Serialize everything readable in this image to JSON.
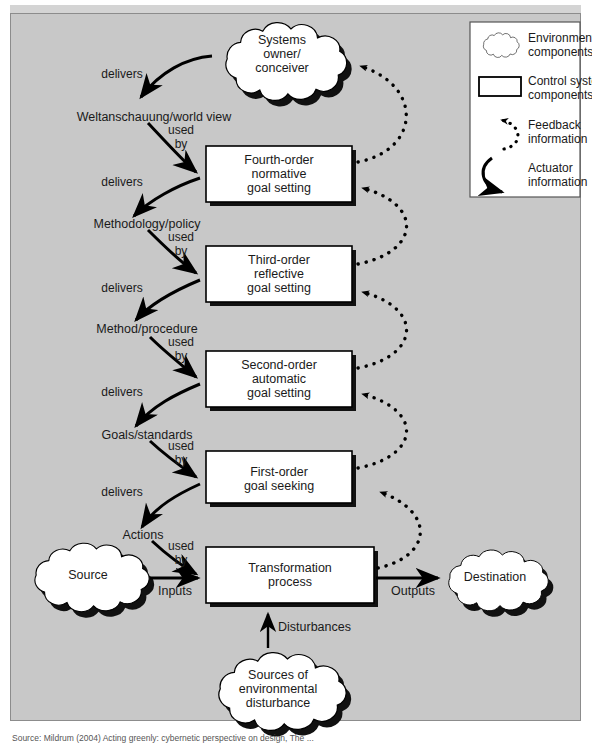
{
  "figure": {
    "background_color": "#c8c8c8",
    "frame_border_color": "#8c8c8c",
    "shape_fill": "#ffffff",
    "shape_stroke": "#000000",
    "caption": "Source: Mildrum (2004) Acting greenly: cybernetic perspective on design, The ..."
  },
  "clouds": {
    "systems_owner": "Systems\nowner/\nconceiver",
    "source": "Source",
    "destination": "Destination",
    "disturbance": "Sources of\nenvironmental\ndisturbance"
  },
  "boxes": [
    {
      "id": "fourth",
      "label": "Fourth-order\nnormative\ngoal setting"
    },
    {
      "id": "third",
      "label": "Third-order\nreflective\ngoal setting"
    },
    {
      "id": "second",
      "label": "Second-order\nautomatic\ngoal setting"
    },
    {
      "id": "first",
      "label": "First-order\ngoal seeking"
    },
    {
      "id": "transform",
      "label": "Transformation\nprocess"
    }
  ],
  "flow_labels": {
    "weltanschauung": "Weltanschauung/world view",
    "methodology": "Methodology/policy",
    "method": "Method/procedure",
    "goals": "Goals/standards",
    "actions": "Actions",
    "inputs": "Inputs",
    "outputs": "Outputs",
    "disturbances": "Disturbances"
  },
  "edge_labels": {
    "delivers": "delivers",
    "used": "used",
    "by": "by"
  },
  "legend": {
    "items": [
      {
        "icon": "cloud-icon",
        "label": "Environmental\ncomponents"
      },
      {
        "icon": "rectangle-icon",
        "label": "Control system\ncomponents"
      },
      {
        "icon": "dotted-arrow-icon",
        "label": "Feedback\ninformation"
      },
      {
        "icon": "solid-arrow-icon",
        "label": "Actuator\ninformation"
      }
    ]
  }
}
